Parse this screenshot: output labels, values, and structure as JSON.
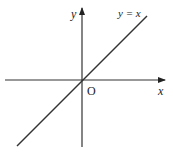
{
  "diagram": {
    "type": "coordinate-plane",
    "axes": {
      "x_label": "x",
      "y_label": "y",
      "origin_label": "O"
    },
    "line": {
      "equation_label": "y = x",
      "slope": 1,
      "intercept": 0
    },
    "colors": {
      "axis": "#333333",
      "line": "#333333",
      "background": "#ffffff"
    }
  }
}
